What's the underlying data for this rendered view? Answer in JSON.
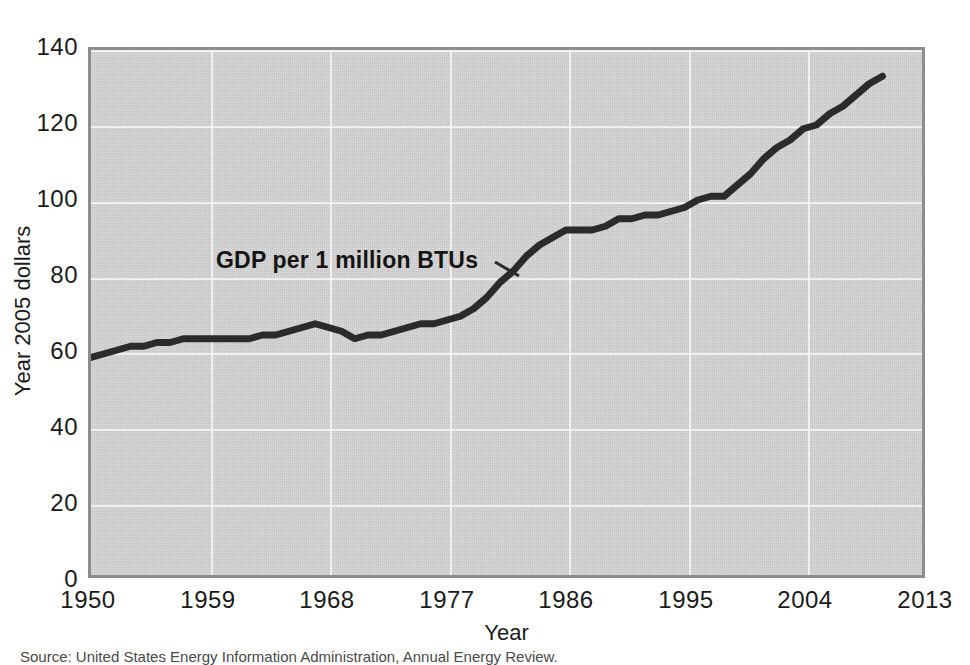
{
  "chart_data": {
    "type": "line",
    "title": "",
    "xlabel": "Year",
    "ylabel": "Year 2005 dollars",
    "xlim": [
      1950,
      2013
    ],
    "ylim": [
      0,
      140
    ],
    "grid": true,
    "legend_position": "inline-annotation",
    "series": [
      {
        "name": "GDP per 1 million BTUs",
        "x": [
          1950,
          1951,
          1952,
          1953,
          1954,
          1955,
          1956,
          1957,
          1958,
          1959,
          1960,
          1961,
          1962,
          1963,
          1964,
          1965,
          1966,
          1967,
          1968,
          1969,
          1970,
          1971,
          1972,
          1973,
          1974,
          1975,
          1976,
          1977,
          1978,
          1979,
          1980,
          1981,
          1982,
          1983,
          1984,
          1985,
          1986,
          1987,
          1988,
          1989,
          1990,
          1991,
          1992,
          1993,
          1994,
          1995,
          1996,
          1997,
          1998,
          1999,
          2000,
          2001,
          2002,
          2003,
          2004,
          2005,
          2006,
          2007,
          2008,
          2009,
          2010
        ],
        "values": [
          58,
          59,
          60,
          61,
          61,
          62,
          62,
          63,
          63,
          63,
          63,
          63,
          63,
          64,
          64,
          65,
          66,
          67,
          66,
          65,
          63,
          64,
          64,
          65,
          66,
          67,
          67,
          68,
          69,
          71,
          74,
          78,
          81,
          85,
          88,
          90,
          92,
          92,
          92,
          93,
          95,
          95,
          96,
          96,
          97,
          98,
          100,
          101,
          101,
          104,
          107,
          111,
          114,
          116,
          119,
          120,
          123,
          125,
          128,
          131,
          133
        ]
      }
    ],
    "xticks": [
      "1950",
      "1959",
      "1968",
      "1977",
      "1986",
      "1995",
      "2004",
      "2013"
    ],
    "xtick_values": [
      1950,
      1959,
      1968,
      1977,
      1986,
      1995,
      2004,
      2013
    ],
    "yticks": [
      "0",
      "20",
      "40",
      "60",
      "80",
      "100",
      "120",
      "140"
    ],
    "ytick_values": [
      0,
      20,
      40,
      60,
      80,
      100,
      120,
      140
    ],
    "annotation": "GDP per 1 million BTUs",
    "colors": {
      "plot_background": "#cfd0cf",
      "gridline": "#f2f3f2",
      "line": "#2b2b2b",
      "border": "#8b8d8b",
      "text": "#1b1b1b"
    }
  },
  "source_note": "Source: United States Energy Information Administration, Annual Energy Review."
}
